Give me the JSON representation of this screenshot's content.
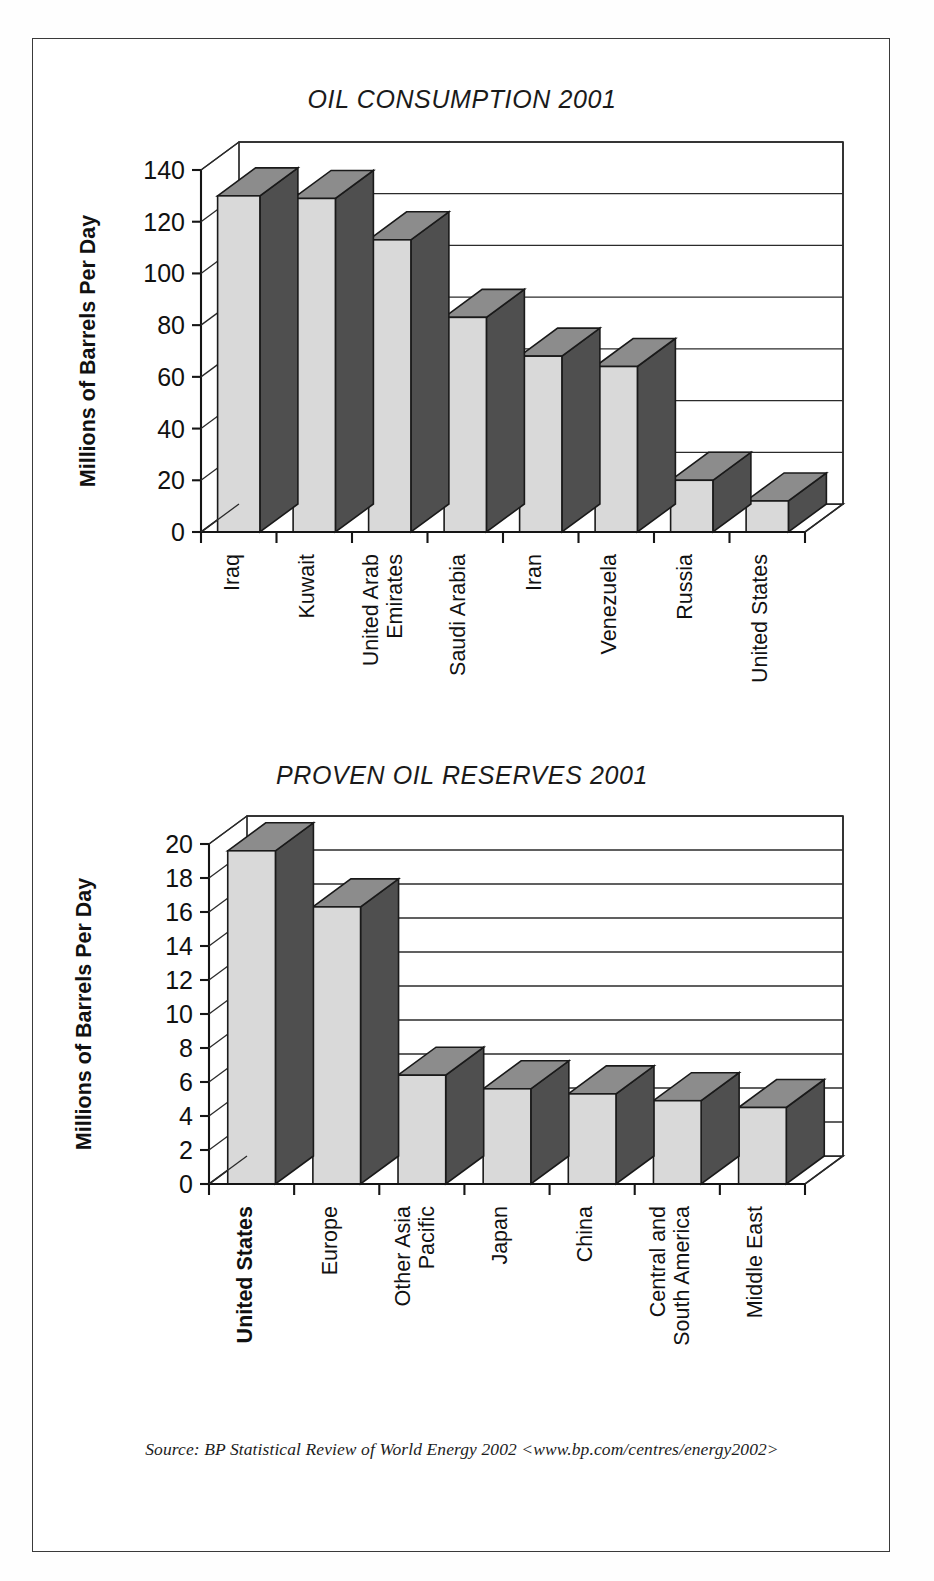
{
  "document": {
    "source_note": "Source: BP Statistical Review of World Energy 2002 <www.bp.com/centres/energy2002>"
  },
  "chart_data": [
    {
      "type": "bar",
      "title": "OIL CONSUMPTION 2001",
      "xlabel": "",
      "ylabel": "Millions of Barrels Per Day",
      "ylim": [
        0,
        140
      ],
      "ytick_step": 20,
      "yticks": [
        0,
        20,
        40,
        60,
        80,
        100,
        120,
        140
      ],
      "grid": true,
      "legend": "none",
      "style": "3d-column",
      "categories": [
        "Iraq",
        "Kuwait",
        "United Arab Emirates",
        "Saudi Arabia",
        "Iran",
        "Venezuela",
        "Russia",
        "United States"
      ],
      "values": [
        130,
        129,
        113,
        83,
        68,
        64,
        20,
        12
      ],
      "bold_categories": []
    },
    {
      "type": "bar",
      "title": "PROVEN OIL RESERVES 2001",
      "xlabel": "",
      "ylabel": "Millions of Barrels Per Day",
      "ylim": [
        0,
        20
      ],
      "ytick_step": 2,
      "yticks": [
        0,
        2,
        4,
        6,
        8,
        10,
        12,
        14,
        16,
        18,
        20
      ],
      "grid": true,
      "legend": "none",
      "style": "3d-column",
      "categories": [
        "United States",
        "Europe",
        "Other Asia Pacific",
        "Japan",
        "China",
        "Central and South America",
        "Middle East"
      ],
      "values": [
        19.6,
        16.3,
        6.4,
        5.6,
        5.3,
        4.9,
        4.5
      ],
      "bold_categories": [
        "United States"
      ]
    }
  ]
}
